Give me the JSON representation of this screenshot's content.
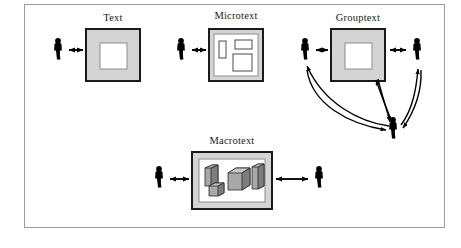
{
  "figure": {
    "title": "",
    "frame": {
      "border_color": "#9a9a9a",
      "background": "#ffffff"
    },
    "colors": {
      "actor": "#000000",
      "box_border": "#1a1a1a",
      "box_fill": "#d4d4d4",
      "inner_fill": "#ffffff",
      "inner_border": "#8c8c8c",
      "arrow": "#000000",
      "block_fill": "#a8a8a8",
      "block_top": "#c9c9c9",
      "block_side": "#7d7d7d"
    }
  },
  "panels": [
    {
      "id": "text",
      "label": "Text",
      "box_type": "single-square",
      "actors": 1,
      "actor_side": "left",
      "connection": "bidirectional-arrow",
      "inner_shapes": 1
    },
    {
      "id": "microtext",
      "label": "Microtext",
      "box_type": "panel-with-subshapes",
      "actors": 1,
      "actor_side": "left",
      "connection": "bidirectional-arrow",
      "inner_shapes": 3
    },
    {
      "id": "grouptext",
      "label": "Grouptext",
      "box_type": "single-square",
      "actors": 3,
      "actor_side": "left-right-bottom",
      "connection": "bidirectional-arrows-and-curves",
      "inner_shapes": 1
    },
    {
      "id": "macrotext",
      "label": "Macrotext",
      "box_type": "wide-panel-with-blocks",
      "actors": 2,
      "actor_side": "left-and-right",
      "connection": "bidirectional-arrow",
      "inner_shapes": 4
    }
  ],
  "icons": {
    "actor": "person-icon",
    "arrow": "double-headed-arrow-icon",
    "curve": "curved-arrow-icon",
    "block": "three-d-block-icon"
  }
}
